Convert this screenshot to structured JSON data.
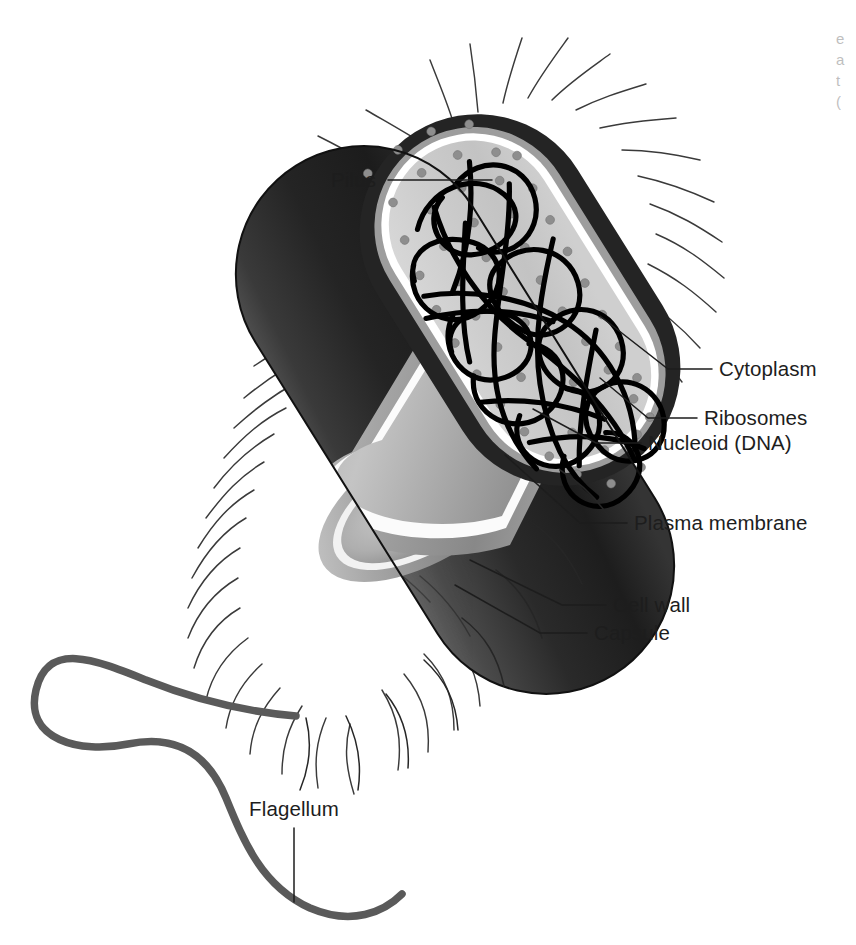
{
  "figure": {
    "background_color": "#ffffff"
  },
  "colors": {
    "capsule": "#2b2b2b",
    "capsule_dark": "#1a1a1a",
    "cell_wall": "#9a9a9a",
    "plasma_membrane": "#ffffff",
    "cytoplasm": "#c9c9c9",
    "cytoplasm_light": "#d8d8d8",
    "ribosome": "#8e8e8e",
    "nucleoid": "#000000",
    "pilus": "#3a3a3a",
    "flagellum": "#5a5a5a",
    "label_text": "#1d1d1d",
    "leader_line": "#1d1d1d"
  },
  "labels": [
    {
      "id": "pilus",
      "text": "Pilus",
      "side": "left",
      "text_x": 376,
      "text_y": 187,
      "leader": "M 388 180 L 492 180"
    },
    {
      "id": "cytoplasm",
      "text": "Cytoplasm",
      "side": "right",
      "text_x": 719,
      "text_y": 376,
      "leader": "M 712 369 L 668 369 L 600 316"
    },
    {
      "id": "ribosomes",
      "text": "Ribosomes",
      "side": "right",
      "text_x": 704,
      "text_y": 425,
      "leader": "M 697 418 L 648 418 L 600 378"
    },
    {
      "id": "nucleoid",
      "text": "Nucleoid (DNA)",
      "side": "right",
      "text_x": 648,
      "text_y": 450,
      "leader": "M 641 443 L 596 443 L 533 409"
    },
    {
      "id": "plasma-membrane",
      "text": "Plasma membrane",
      "side": "right",
      "text_x": 634,
      "text_y": 530,
      "leader": "M 627 523 L 580 523 L 505 455"
    },
    {
      "id": "cell-wall",
      "text": "Cell wall",
      "side": "right",
      "text_x": 613,
      "text_y": 612,
      "leader": "M 606 605 L 562 605 L 470 560"
    },
    {
      "id": "capsule",
      "text": "Capsule",
      "side": "right",
      "text_x": 594,
      "text_y": 640,
      "leader": "M 587 633 L 540 633 L 455 585"
    },
    {
      "id": "flagellum",
      "text": "Flagellum",
      "side": "below",
      "text_x": 294,
      "text_y": 816,
      "leader": "M 294 828 L 294 902"
    }
  ],
  "structures": {
    "capsule_label": "Capsule (outermost sticky layer)",
    "cell_wall_label": "Cell wall (rigid peptidoglycan layer)",
    "plasma_membrane_label": "Plasma membrane (thin white boundary)",
    "cytoplasm_label": "Cytoplasm (light gray interior)",
    "ribosome_label": "Ribosomes (small gray dots)",
    "nucleoid_label": "Nucleoid (tangled black DNA loop)",
    "pilus_label": "Pili (fine hairs around the cell)",
    "flagellum_label": "Flagellum (long whip-like tail)"
  },
  "geometry": {
    "cell_angle_degrees": 328,
    "cell_center_x": 455,
    "cell_center_y": 420,
    "cell_length": 600,
    "cell_width": 255,
    "ribosome_count": 54,
    "pilus_count": 78
  },
  "caption_fragment": {
    "lines": [
      "e",
      "a",
      "t",
      "("
    ]
  }
}
